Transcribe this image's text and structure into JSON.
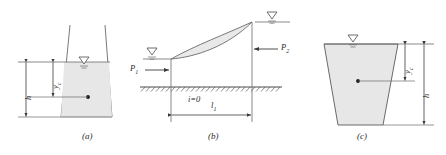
{
  "figure": {
    "panels": [
      {
        "id": "a",
        "caption": "(a)",
        "type": "trapezoidal-cross-section",
        "labels": {
          "depth": "h",
          "centroid_depth": "y",
          "centroid_depth_sub": "c"
        },
        "markers": {
          "water_surface": "water-surface-triangle",
          "centroid": "centroid-dot"
        }
      },
      {
        "id": "b",
        "caption": "(b)",
        "type": "longitudinal-backwater-profile",
        "labels": {
          "upstream_force": "P",
          "upstream_force_sub": "1",
          "downstream_force": "P",
          "downstream_force_sub": "2",
          "slope": "i=0",
          "length": "l",
          "length_sub": "1"
        },
        "markers": {
          "bed": "hatched-bed-line",
          "upstream_water_surface": "water-surface-triangle",
          "downstream_water_surface": "water-surface-triangle"
        }
      },
      {
        "id": "c",
        "caption": "(c)",
        "type": "trapezoidal-cross-section",
        "labels": {
          "centroid_depth": "y",
          "centroid_depth_sub": "c",
          "depth": "h"
        },
        "markers": {
          "water_surface": "water-surface-triangle",
          "centroid": "centroid-dot"
        }
      }
    ],
    "colors": {
      "line": "#4a4a4a",
      "fill": "#e6e6e6",
      "text": "#2b2b2b"
    }
  }
}
